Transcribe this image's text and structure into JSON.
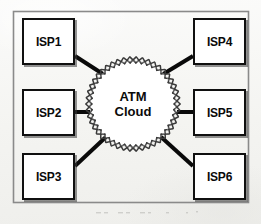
{
  "diagram": {
    "frame": {
      "x": 13,
      "y": 11,
      "width": 235,
      "height": 191,
      "border_color": "#8a8a8a"
    },
    "background_color": "#f6f6f4",
    "line_color": "#0a0a0a",
    "box_border_color": "#101010",
    "box_fill_color": "#ffffff",
    "cloud": {
      "name": "atm-cloud",
      "label_lines": [
        "ATM",
        "Cloud"
      ],
      "center_x": 133,
      "center_y": 104,
      "radius": 44,
      "border_style": "scalloped-zigzag",
      "fill_color": "#ffffff",
      "border_color": "#3a3a3a"
    },
    "nodes": [
      {
        "id": "isp1",
        "label": "ISP1",
        "x": 22,
        "y": 18,
        "width": 53,
        "height": 47,
        "column": "left",
        "row": "top"
      },
      {
        "id": "isp2",
        "label": "ISP2",
        "x": 22,
        "y": 89,
        "width": 53,
        "height": 47,
        "column": "left",
        "row": "middle"
      },
      {
        "id": "isp3",
        "label": "ISP3",
        "x": 22,
        "y": 153,
        "width": 53,
        "height": 47,
        "column": "left",
        "row": "bottom"
      },
      {
        "id": "isp4",
        "label": "ISP4",
        "x": 193,
        "y": 18,
        "width": 53,
        "height": 47,
        "column": "right",
        "row": "top"
      },
      {
        "id": "isp5",
        "label": "ISP5",
        "x": 193,
        "y": 89,
        "width": 53,
        "height": 47,
        "column": "right",
        "row": "middle"
      },
      {
        "id": "isp6",
        "label": "ISP6",
        "x": 193,
        "y": 153,
        "width": 53,
        "height": 47,
        "column": "right",
        "row": "bottom"
      }
    ],
    "links": [
      {
        "id": "link-isp1-cloud",
        "from": "isp1",
        "to": "atm-cloud",
        "kind": "diagonal",
        "x1": 75,
        "y1": 56,
        "x2": 106,
        "y2": 76,
        "width": 4
      },
      {
        "id": "link-isp2-cloud",
        "from": "isp2",
        "to": "atm-cloud",
        "kind": "horizontal",
        "x1": 75,
        "y1": 112,
        "x2": 90,
        "y2": 112,
        "width": 4
      },
      {
        "id": "link-isp3-cloud",
        "from": "isp3",
        "to": "atm-cloud",
        "kind": "diagonal",
        "x1": 75,
        "y1": 166,
        "x2": 107,
        "y2": 136,
        "width": 4
      },
      {
        "id": "link-isp4-cloud",
        "from": "isp4",
        "to": "atm-cloud",
        "kind": "diagonal",
        "x1": 193,
        "y1": 56,
        "x2": 160,
        "y2": 76,
        "width": 4
      },
      {
        "id": "link-isp5-cloud",
        "from": "isp5",
        "to": "atm-cloud",
        "kind": "horizontal",
        "x1": 193,
        "y1": 112,
        "x2": 177,
        "y2": 112,
        "width": 4
      },
      {
        "id": "link-isp6-cloud",
        "from": "isp6",
        "to": "atm-cloud",
        "kind": "diagonal",
        "x1": 193,
        "y1": 166,
        "x2": 160,
        "y2": 136,
        "width": 4
      }
    ]
  }
}
